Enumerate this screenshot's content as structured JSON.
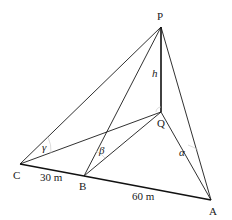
{
  "diagram": {
    "points": {
      "P": {
        "label": "P",
        "x": 161,
        "y": 27
      },
      "Q": {
        "label": "Q",
        "x": 161,
        "y": 112
      },
      "C": {
        "label": "C",
        "x": 20,
        "y": 164
      },
      "B": {
        "label": "B",
        "x": 84,
        "y": 176
      },
      "A": {
        "label": "A",
        "x": 211,
        "y": 200
      }
    },
    "labels": {
      "height": "h",
      "alpha": "α",
      "beta": "β",
      "gamma": "γ",
      "cb_distance": "30 m",
      "ba_distance": "60 m"
    },
    "edges": [
      {
        "from": "P",
        "to": "Q",
        "style": "bold",
        "label": "h"
      },
      {
        "from": "P",
        "to": "C",
        "style": "thin"
      },
      {
        "from": "P",
        "to": "B",
        "style": "thin"
      },
      {
        "from": "P",
        "to": "A",
        "style": "thin"
      },
      {
        "from": "Q",
        "to": "C",
        "style": "thin"
      },
      {
        "from": "Q",
        "to": "B",
        "style": "thin"
      },
      {
        "from": "Q",
        "to": "A",
        "style": "thin"
      },
      {
        "from": "C",
        "to": "B",
        "style": "bold",
        "label": "30 m"
      },
      {
        "from": "B",
        "to": "A",
        "style": "bold",
        "label": "60 m"
      }
    ],
    "angles": [
      {
        "name": "gamma",
        "vertex": "C",
        "between": [
          "P",
          "Q"
        ]
      },
      {
        "name": "beta",
        "vertex": "B",
        "between": [
          "P",
          "Q"
        ]
      },
      {
        "name": "alpha",
        "vertex": "A",
        "between": [
          "P",
          "Q"
        ]
      }
    ]
  }
}
